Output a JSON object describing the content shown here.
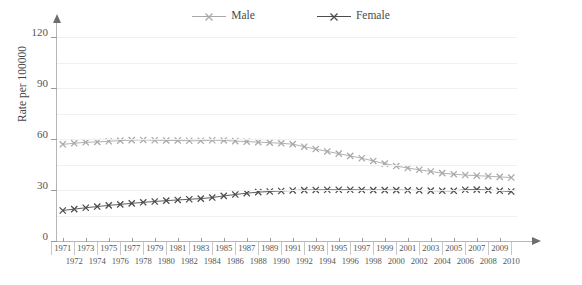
{
  "legend": {
    "position": "top-center",
    "items": [
      {
        "label": "Male",
        "color": "#a8a8a8",
        "marker": "x-marker"
      },
      {
        "label": "Female",
        "color": "#4c4c4c",
        "marker": "x-marker"
      }
    ]
  },
  "axes": {
    "ylabel": "Rate per 100000",
    "yticks": [
      0,
      30,
      60,
      90,
      120
    ],
    "ylim": [
      0,
      125
    ],
    "xlabel": "",
    "grid": true,
    "grid_step": 15
  },
  "chart_data": {
    "type": "line",
    "title": "",
    "xlabel": "",
    "ylabel": "Rate per 100000",
    "ylim": [
      0,
      125
    ],
    "yticks": [
      0,
      30,
      60,
      90,
      120
    ],
    "grid": true,
    "legend_position": "top-center",
    "x": [
      1971,
      1972,
      1973,
      1974,
      1975,
      1976,
      1977,
      1978,
      1979,
      1980,
      1981,
      1982,
      1983,
      1984,
      1985,
      1986,
      1987,
      1988,
      1989,
      1990,
      1991,
      1992,
      1993,
      1994,
      1995,
      1996,
      1997,
      1998,
      1999,
      2000,
      2001,
      2002,
      2003,
      2004,
      2005,
      2006,
      2007,
      2008,
      2009,
      2010
    ],
    "series": [
      {
        "name": "Male",
        "color": "#a8a8a8",
        "marker": "x-marker",
        "values": [
          57.0,
          57.6,
          58.2,
          58.4,
          58.8,
          59.2,
          59.5,
          59.6,
          59.4,
          59.3,
          59.3,
          59.1,
          59.1,
          59.4,
          59.3,
          58.9,
          58.6,
          58.3,
          58.0,
          57.6,
          57.1,
          55.6,
          54.2,
          52.8,
          51.5,
          50.2,
          48.8,
          47.2,
          45.6,
          44.2,
          43.0,
          42.0,
          41.0,
          40.0,
          39.4,
          38.9,
          38.5,
          38.2,
          37.8,
          37.4
        ]
      },
      {
        "name": "Female",
        "color": "#4c4c4c",
        "marker": "x-marker",
        "values": [
          18.0,
          18.8,
          19.6,
          20.3,
          21.0,
          21.6,
          22.2,
          22.8,
          23.3,
          23.8,
          24.2,
          24.6,
          25.0,
          25.6,
          26.6,
          27.4,
          28.2,
          28.8,
          29.2,
          29.5,
          29.8,
          30.0,
          30.1,
          30.2,
          30.2,
          30.2,
          30.1,
          30.0,
          30.0,
          30.0,
          29.9,
          29.8,
          29.7,
          29.6,
          29.6,
          30.2,
          30.3,
          30.0,
          29.6,
          29.2
        ]
      }
    ]
  },
  "xaxis_rows": {
    "top": [
      1971,
      1973,
      1975,
      1977,
      1979,
      1981,
      1983,
      1985,
      1987,
      1989,
      1991,
      1993,
      1995,
      1997,
      1999,
      2001,
      2003,
      2005,
      2007,
      2009
    ],
    "bottom": [
      1972,
      1974,
      1976,
      1978,
      1980,
      1982,
      1984,
      1986,
      1988,
      1990,
      1992,
      1994,
      1996,
      1998,
      2000,
      2002,
      2004,
      2006,
      2008,
      2010
    ]
  }
}
